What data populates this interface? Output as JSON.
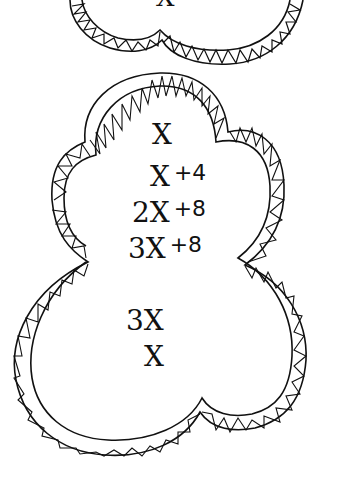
{
  "worksheet": {
    "top_shape": {
      "expressions": [
        "X"
      ]
    },
    "main_shape": {
      "expressions": [
        {
          "term": "X",
          "addend": ""
        },
        {
          "term": "X",
          "addend": "+4"
        },
        {
          "term": "2X",
          "addend": "+8"
        },
        {
          "term": "3X",
          "addend": "+8"
        },
        {
          "term": "3X",
          "addend": ""
        },
        {
          "term": "X",
          "addend": ""
        }
      ]
    },
    "colors": {
      "ink": "#111111",
      "background": "#ffffff"
    }
  }
}
